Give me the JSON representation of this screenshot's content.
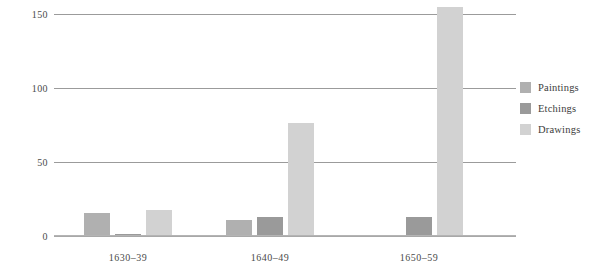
{
  "chart_data": {
    "type": "bar",
    "title": "",
    "subtitle": "",
    "xlabel": "",
    "ylabel": "",
    "categories": [
      "1630–39",
      "1640–49",
      "1650–59"
    ],
    "series": [
      {
        "name": "Paintings",
        "values": [
          15,
          10,
          0
        ],
        "color": "#b0b0b0"
      },
      {
        "name": "Etchings",
        "values": [
          1,
          12,
          12
        ],
        "color": "#9a9a9a"
      },
      {
        "name": "Drawings",
        "values": [
          17,
          76,
          154
        ],
        "color": "#d2d2d2"
      }
    ],
    "ylim": [
      0,
      160
    ],
    "yticks": [
      0,
      50,
      100,
      150
    ],
    "ytick_labels": [
      "0",
      "50",
      "100",
      "150"
    ],
    "grid": true,
    "grid_axis": "y",
    "legend_position": "right",
    "bar_group_mode": "grouped"
  },
  "axis": {
    "tick_0": "0",
    "tick_50": "50",
    "tick_100": "100",
    "tick_150": "150"
  },
  "xaxis": {
    "label_1": "1630–39",
    "label_2": "1640–49",
    "label_3": "1650–59"
  },
  "legend": {
    "items": [
      {
        "label": "Paintings"
      },
      {
        "label": "Etchings"
      },
      {
        "label": "Drawings"
      }
    ]
  },
  "colors": {
    "paintings": "#b0b0b0",
    "etchings": "#9a9a9a",
    "drawings": "#d2d2d2",
    "gridline": "#9b9b9b",
    "text": "#3a3a3a",
    "background": "#ffffff"
  }
}
